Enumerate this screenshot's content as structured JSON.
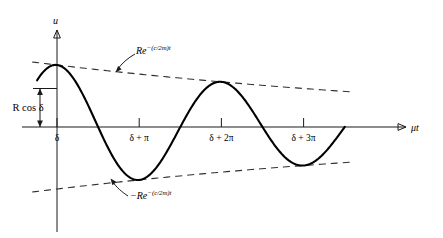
{
  "figure": {
    "background_color": "#ffffff",
    "curve_color": "#000000",
    "envelope_color": "#303030",
    "axis_color": "#1a1a1a"
  },
  "axes": {
    "x_axis_label": "μt",
    "y_axis_label": "u",
    "x_ticks": [
      {
        "label": "δ",
        "value": 0
      },
      {
        "label": "δ + π",
        "value": 3.14159
      },
      {
        "label": "δ + 2π",
        "value": 6.28319
      },
      {
        "label": "δ + 3π",
        "value": 9.42478
      }
    ],
    "y_ticks": [],
    "grid": false
  },
  "annotations": {
    "upper_envelope": {
      "base": "Re",
      "exponent": "−(c/2m)t",
      "full": "Re^-(c/2m)t"
    },
    "lower_envelope": {
      "base": "−Re",
      "exponent": "−(c/2m)t",
      "full": "-Re^-(c/2m)t"
    },
    "amplitude_measure": {
      "label": "R cos δ",
      "label_plain": "R cos d"
    }
  },
  "chart_data": {
    "type": "line",
    "xlabel": "μt",
    "ylabel": "u",
    "grid": false,
    "legend": "none",
    "xlim": [
      -0.92,
      11.1
    ],
    "ylim": [
      -1.15,
      1.15
    ],
    "damping_ratio_per_radian": 0.0505,
    "amplitude_R": 1.0,
    "phase_delta_label": "δ",
    "initial_value_label": "R cos δ",
    "initial_value": 0.72,
    "series": [
      {
        "name": "u(t) = Re^-(c/2m)t cos(μt − δ)",
        "type": "line",
        "style": "solid",
        "points_note": "damped cosine, peaks at δ, δ+2π; troughs at δ+π, δ+3π",
        "extrema": [
          {
            "x_label": "δ",
            "x": 0,
            "y": 0.952
          },
          {
            "x_label": "δ + π",
            "x": 3.14159,
            "y": -0.812
          },
          {
            "x_label": "δ + 2π",
            "x": 6.28319,
            "y": 0.693
          },
          {
            "x_label": "δ + 3π",
            "x": 9.42478,
            "y": -0.592
          }
        ],
        "zero_crossings": [
          1.571,
          4.712,
          7.854,
          10.996
        ]
      },
      {
        "name": "Re^-(c/2m)t",
        "type": "envelope-upper",
        "style": "dashed",
        "values_note": "exponential decay envelope, positive"
      },
      {
        "name": "-Re^-(c/2m)t",
        "type": "envelope-lower",
        "style": "dashed",
        "values_note": "exponential decay envelope, negative"
      }
    ]
  }
}
